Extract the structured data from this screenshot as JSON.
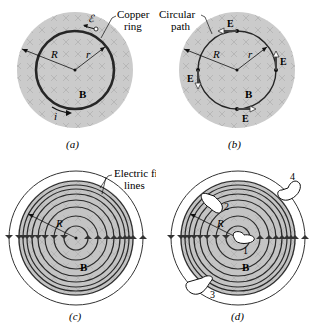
{
  "figure": {
    "panels": [
      {
        "id": "a",
        "caption": "(a)",
        "labels": {
          "emf": "ℰ",
          "ring": "Copper ring",
          "ring_line1": "Copper",
          "ring_line2": "ring",
          "R": "R",
          "r": "r",
          "B": "B",
          "i": "i"
        }
      },
      {
        "id": "b",
        "caption": "(b)",
        "labels": {
          "path_line1": "Circular",
          "path_line2": "path",
          "R": "R",
          "r": "r",
          "B": "B",
          "E": "E"
        }
      },
      {
        "id": "c",
        "caption": "(c)",
        "labels": {
          "field_line1": "Electric field",
          "field_line2": "lines",
          "R": "R",
          "B": "B"
        }
      },
      {
        "id": "d",
        "caption": "(d)",
        "labels": {
          "R": "R",
          "B": "B",
          "path1": "1",
          "path2": "2",
          "path3": "3",
          "path4": "4"
        }
      }
    ],
    "colors": {
      "field_region": "#c8c8c8",
      "field_region_dark": "#a9a9a9",
      "line": "#222222",
      "cross": "#b0b0b0"
    }
  }
}
